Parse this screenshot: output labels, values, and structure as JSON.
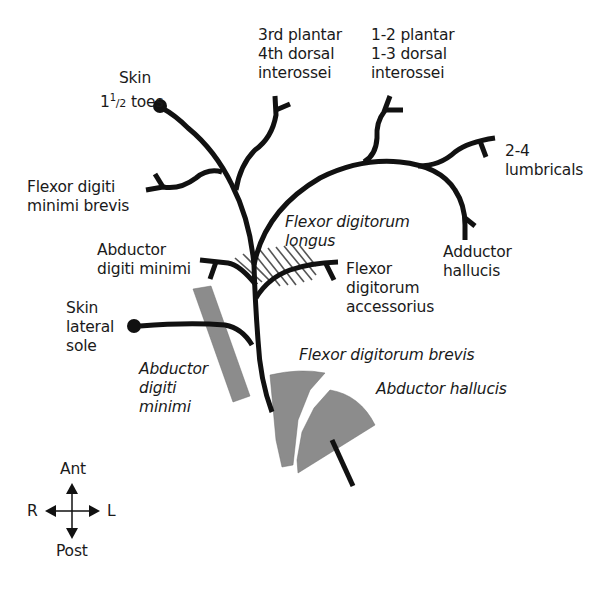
{
  "diagram": {
    "labels": {
      "skin_toes_1": "Skin",
      "skin_toes_2a": "1",
      "skin_toes_2b": "1/2",
      "skin_toes_2c": " toes",
      "third_plantar": "3rd plantar\n4th dorsal\ninterossei",
      "one_two_plantar": "1-2 plantar\n1-3 dorsal\ninterossei",
      "lumbricals": "2-4\nlumbricals",
      "fdmb": "Flexor digiti\nminimi brevis",
      "adm_branch": "Abductor\ndigiti minimi",
      "skin_lateral": "Skin\nlateral\nsole",
      "adductor_hallucis": "Adductor\nhallucis",
      "fda": "Flexor\ndigitorum\naccessorius",
      "fdl": "Flexor digitorum\nlongus",
      "fdb": "Flexor digitorum brevis",
      "abductor_hallucis": "Abductor hallucis",
      "adm_muscle": "Abductor\ndigiti\nminimi"
    },
    "compass": {
      "ant": "Ant",
      "post": "Post",
      "r": "R",
      "l": "L"
    },
    "colors": {
      "nerve": "#111111",
      "muscle": "#8c8c8c",
      "hatch": "#555555",
      "background": "#ffffff"
    }
  }
}
